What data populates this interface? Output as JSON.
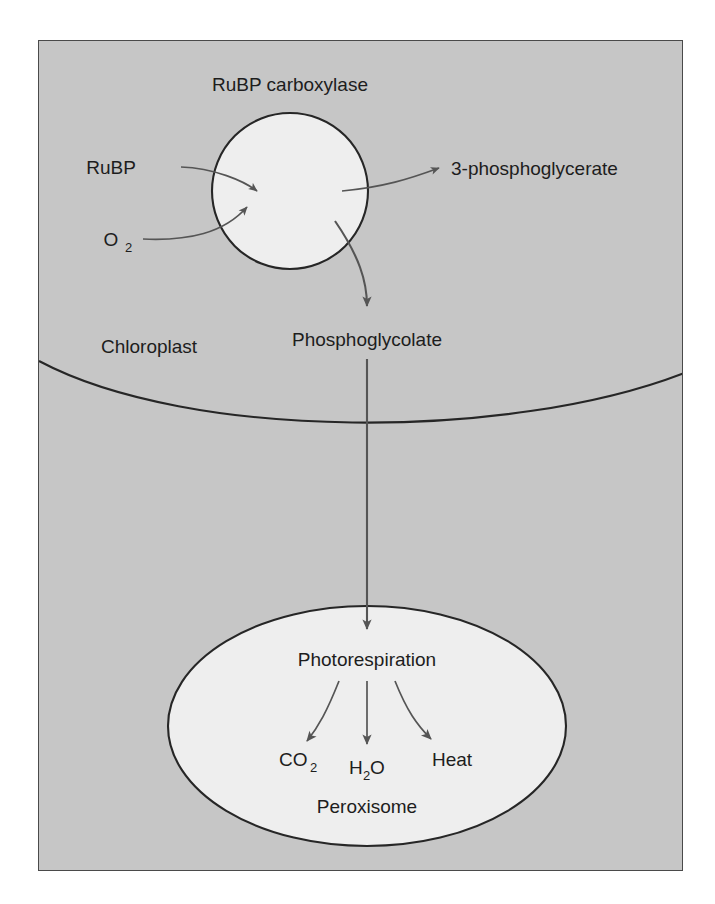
{
  "figure": {
    "background_color": "#ffffff",
    "panel_color": "#c6c6c6",
    "organelle_fill": "#eeeeee",
    "line_color": "#262626",
    "arrow_color": "#555555",
    "text_color": "#1d1d1d"
  },
  "labels": {
    "enzyme_title": "RuBP carboxylase",
    "substrate_rubp": "RuBP",
    "substrate_o2_main": "O",
    "substrate_o2_sub": "2",
    "product_pga": "3-phosphoglycerate",
    "product_phosphoglycolate": "Phosphoglycolate",
    "compartment_chloroplast": "Chloroplast",
    "compartment_peroxisome": "Peroxisome",
    "process_photorespiration": "Photorespiration",
    "output_co2_main": "CO",
    "output_co2_sub": "2",
    "output_h2o_h": "H",
    "output_h2o_sub": "2",
    "output_h2o_o": "O",
    "output_heat": "Heat"
  },
  "flow": {
    "inputs": [
      "RuBP",
      "O2"
    ],
    "enzyme": "RuBP carboxylase",
    "products": [
      "3-phosphoglycerate",
      "Phosphoglycolate"
    ],
    "destination": "Peroxisome",
    "process": "Photorespiration",
    "outputs": [
      "CO2",
      "H2O",
      "Heat"
    ]
  }
}
